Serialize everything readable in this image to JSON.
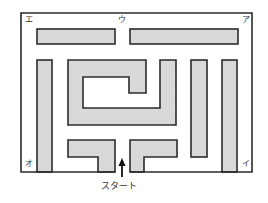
{
  "diagram": {
    "type": "maze",
    "colors": {
      "wall_fill": "#d9d9d9",
      "wall_stroke": "#2b2b2b",
      "background": "#ffffff"
    },
    "corner_labels": {
      "top_left": "エ",
      "top_center": "ウ",
      "top_right": "ア",
      "bottom_left": "オ",
      "bottom_right": "イ"
    },
    "start_label": "スタート"
  }
}
